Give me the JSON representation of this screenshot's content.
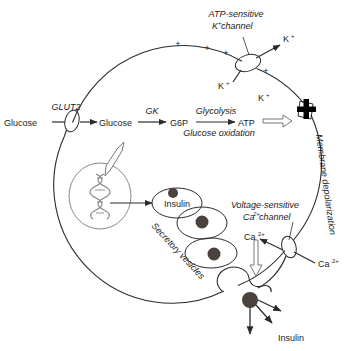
{
  "diagram": {
    "type": "biological-pathway-diagram",
    "background_color": "#ffffff",
    "line_color": "#2b2b2b",
    "organelle_color": "#8a8a8a",
    "granule_color": "#4b423d",
    "hollow_arrow_color": "#767676"
  },
  "labels": {
    "atp_channel_line1": "ATP-sensitive",
    "atp_channel_line2": "K",
    "atp_channel_line2_sup": "+",
    "atp_channel_line2_rest": " channel",
    "k_out": "K",
    "k_out_sup": "+",
    "k_mid": "K",
    "k_mid_sup": "+",
    "k_low": "K",
    "k_low_sup": "+",
    "plus_1": "+",
    "plus_2": "+",
    "plus_3": "+",
    "plus_4": "+",
    "glut2": "GLUT2",
    "glucose_out": "Glucose",
    "glucose_in": "Glucose",
    "gk": "GK",
    "g6p": "G6P",
    "glycolysis": "Glycolysis",
    "glucose_oxidation": "Glucose oxidation",
    "atp": "ATP",
    "membrane_depolarization": "Membrane depolarization",
    "insulin_vesicle": "Insulin",
    "secretory_vesicles": "Secretory vesicles",
    "ca_channel_line1": "Voltage-sensitive",
    "ca_channel_line2": "Ca",
    "ca_channel_line2_sup": "2+",
    "ca_channel_line2_rest": " channel",
    "ca_in": "Ca",
    "ca_in_sup": "2+",
    "ca_out": "Ca",
    "ca_out_sup": "2+",
    "insulin_released": "Insulin"
  },
  "structures": {
    "cell_membrane": "large-circle",
    "nucleus": "ellipse-with-dna-helix",
    "glut2_transporter": "membrane-ellipse",
    "katp_channel": "membrane-ellipse",
    "calcium_channel": "membrane-ellipse",
    "depolarization_marker": "bold-cross",
    "vesicle_count": 4,
    "exocytosis_site": "fused-vesicle-at-membrane"
  }
}
